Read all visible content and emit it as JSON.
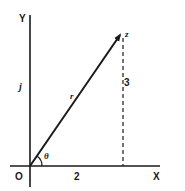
{
  "diagram": {
    "type": "argand-diagram",
    "axes": {
      "x_label": "X",
      "y_label": "Y",
      "origin_label": "O",
      "imaginary_unit_label": "j"
    },
    "vector": {
      "label": "r",
      "tip_label": "z",
      "angle_label": "θ"
    },
    "components": {
      "real": "2",
      "imaginary": "3"
    },
    "colors": {
      "ink": "#1a1a1a",
      "background": "#ffffff"
    }
  }
}
